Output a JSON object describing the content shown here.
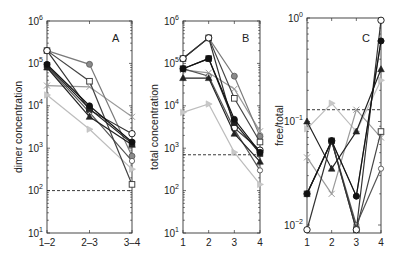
{
  "chart_data": [
    {
      "type": "line",
      "panel": "A",
      "title": "A",
      "xlabel": "",
      "ylabel": "dimer concentration",
      "yscale": "log",
      "ylim": [
        10,
        1000000
      ],
      "yticks": [
        "10^1",
        "10^2",
        "10^3",
        "10^4",
        "10^5",
        "10^6"
      ],
      "categories": [
        "1–2",
        "2–3",
        "3–4"
      ],
      "threshold": 100,
      "series": [
        {
          "name": "open circle",
          "marker": "circle-open",
          "color": "#333333",
          "values": [
            200000,
            8000,
            2200
          ]
        },
        {
          "name": "gray circle",
          "marker": "circle-gray",
          "color": "#7a7a7a",
          "values": [
            200000,
            95000,
            650
          ]
        },
        {
          "name": "open square",
          "marker": "square-open",
          "color": "#444444",
          "values": [
            200000,
            38000,
            140
          ]
        },
        {
          "name": "filled circle",
          "marker": "circle-filled",
          "color": "#111111",
          "values": [
            95000,
            10000,
            1400
          ]
        },
        {
          "name": "filled square",
          "marker": "square-filled",
          "color": "#222222",
          "values": [
            90000,
            8500,
            1300
          ]
        },
        {
          "name": "filled triangle",
          "marker": "triangle-filled",
          "color": "#222222",
          "values": [
            80000,
            5500,
            1200
          ]
        },
        {
          "name": "open diamond",
          "marker": "circle-open-small",
          "color": "#555555",
          "values": [
            85000,
            7000,
            500
          ]
        },
        {
          "name": "light gray x",
          "marker": "x-gray",
          "color": "#9a9a9a",
          "values": [
            30000,
            28000,
            5500
          ]
        },
        {
          "name": "light star",
          "marker": "triangle-light",
          "color": "#bdbdbd",
          "values": [
            18000,
            2800,
            320
          ]
        }
      ]
    },
    {
      "type": "line",
      "panel": "B",
      "title": "B",
      "xlabel": "",
      "ylabel": "total concentration",
      "yscale": "log",
      "ylim": [
        10,
        1000000
      ],
      "yticks": [
        "10^1",
        "10^2",
        "10^3",
        "10^4",
        "10^5",
        "10^6"
      ],
      "categories": [
        "1",
        "2",
        "3",
        "4"
      ],
      "threshold": 700,
      "series": [
        {
          "name": "open circle",
          "marker": "circle-open",
          "color": "#333333",
          "values": [
            130000,
            400000,
            3000,
            900
          ]
        },
        {
          "name": "gray circle",
          "marker": "circle-gray",
          "color": "#7a7a7a",
          "values": [
            130000,
            400000,
            50000,
            1900
          ]
        },
        {
          "name": "open square",
          "marker": "square-open",
          "color": "#444444",
          "values": [
            130000,
            400000,
            15000,
            1400
          ]
        },
        {
          "name": "filled circle",
          "marker": "circle-filled",
          "color": "#111111",
          "values": [
            75000,
            130000,
            4800,
            800
          ]
        },
        {
          "name": "filled square",
          "marker": "square-filled",
          "color": "#222222",
          "values": [
            75000,
            130000,
            4000,
            750
          ]
        },
        {
          "name": "filled triangle",
          "marker": "triangle-filled",
          "color": "#222222",
          "values": [
            45000,
            45000,
            2200,
            480
          ]
        },
        {
          "name": "open diamond",
          "marker": "circle-open-small",
          "color": "#555555",
          "values": [
            75000,
            50000,
            2800,
            300
          ]
        },
        {
          "name": "light gray x",
          "marker": "x-gray",
          "color": "#9a9a9a",
          "values": [
            70000,
            60000,
            25000,
            2500
          ]
        },
        {
          "name": "light star",
          "marker": "triangle-light",
          "color": "#bdbdbd",
          "values": [
            7000,
            11000,
            800,
            140
          ]
        }
      ]
    },
    {
      "type": "line",
      "panel": "C",
      "title": "C",
      "xlabel": "",
      "ylabel": "free/total",
      "yscale": "log",
      "ylim": [
        0.008,
        1
      ],
      "yticks": [
        "10^-2",
        "10^-1",
        "10^0"
      ],
      "categories": [
        "1",
        "2",
        "3",
        "4"
      ],
      "threshold": 0.13,
      "series": [
        {
          "name": "open circle",
          "marker": "circle-open",
          "color": "#333333",
          "values": [
            0.009,
            0.065,
            0.009,
            0.95
          ]
        },
        {
          "name": "gray circle",
          "marker": "circle-gray",
          "color": "#7a7a7a",
          "values": [
            0.02,
            0.065,
            0.019,
            0.6
          ]
        },
        {
          "name": "open square",
          "marker": "square-open",
          "color": "#444444",
          "values": [
            0.02,
            0.065,
            0.009,
            0.08
          ]
        },
        {
          "name": "filled circle",
          "marker": "circle-filled",
          "color": "#111111",
          "values": [
            0.02,
            0.065,
            0.019,
            0.6
          ]
        },
        {
          "name": "filled triangle",
          "marker": "triangle-filled",
          "color": "#222222",
          "values": [
            0.1,
            0.035,
            0.08,
            0.32
          ]
        },
        {
          "name": "open diamond",
          "marker": "circle-open-small",
          "color": "#555555",
          "values": [
            0.02,
            0.065,
            0.01,
            0.035
          ]
        },
        {
          "name": "light gray x",
          "marker": "x-gray",
          "color": "#9a9a9a",
          "values": [
            0.045,
            0.02,
            0.13,
            0.07
          ]
        },
        {
          "name": "light star",
          "marker": "triangle-light",
          "color": "#bdbdbd",
          "values": [
            0.085,
            0.15,
            0.08,
            0.25
          ]
        }
      ]
    }
  ],
  "panels": {
    "A": {
      "letter": "A",
      "ylabel": "dimer concentration",
      "xticks": [
        "1–2",
        "2–3",
        "3–4"
      ]
    },
    "B": {
      "letter": "B",
      "ylabel": "total concentration",
      "xticks": [
        "1",
        "2",
        "3",
        "4"
      ]
    },
    "C": {
      "letter": "C",
      "ylabel": "free/total",
      "xticks": [
        "1",
        "2",
        "3",
        "4"
      ]
    }
  }
}
